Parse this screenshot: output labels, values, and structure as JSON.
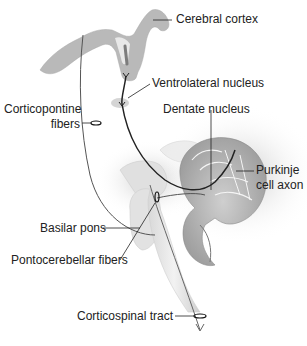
{
  "diagram": {
    "type": "anatomical-pathway",
    "colors": {
      "background": "#ffffff",
      "tissue_light": "#e6e6e6",
      "tissue_mid": "#bdbdbd",
      "tissue_dark": "#8c8c8c",
      "pathway_line": "#2a2a2a",
      "label_text": "#222222"
    },
    "labels": {
      "cerebral_cortex": "Cerebral cortex",
      "ventrolateral_nucleus": "Ventrolateral nucleus",
      "corticopontine_fibers_line1": "Corticopontine",
      "corticopontine_fibers_line2": "fibers",
      "dentate_nucleus": "Dentate nucleus",
      "purkinje_line1": "Purkinje",
      "purkinje_line2": "cell axon",
      "basilar_pons": "Basilar pons",
      "pontocerebellar_fibers": "Pontocerebellar fibers",
      "corticospinal_tract": "Corticospinal tract"
    },
    "structures": [
      "cerebral-cortex",
      "ventrolateral-nucleus",
      "cerebellum",
      "dentate-nucleus",
      "basilar-pons",
      "brainstem",
      "corticospinal-tract"
    ]
  }
}
